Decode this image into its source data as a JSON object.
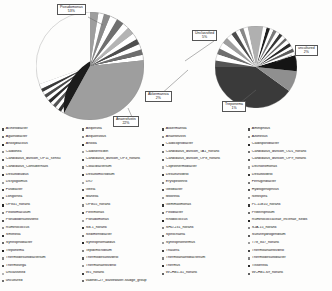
{
  "figure": {
    "background": "#fdfdfc",
    "type": "two-pie-panel"
  },
  "chart_data": [
    {
      "type": "pie",
      "title": "",
      "panel": "left",
      "legend_position": "bottom",
      "labels": [
        "Pseudomonas",
        "Akkermansia",
        "Anaerofustis",
        "Other taxa"
      ],
      "callouts": [
        {
          "name": "Pseudomonas",
          "percent": "53%"
        },
        {
          "name": "Akkermansia",
          "percent": "2%"
        },
        {
          "name": "Anaerofustis",
          "percent": "22%"
        }
      ],
      "categories": [
        "Pseudomonas",
        "Anaerofustis",
        "Akkermansia",
        "Treponema",
        "uncultured",
        "Unclassified",
        "Acinetobacter",
        "Agathobacter",
        "Anoxybacillus",
        "Coprobacillus",
        "Desulfovibrio",
        "Dictyoglomus",
        "Fusibacter",
        "Longilinea",
        "Ruminococcus",
        "Smithella",
        "Syntrophobacter",
        "Thermodesulfobacterium",
        "Thermovirga"
      ],
      "values": [
        53,
        22,
        2,
        1,
        2,
        5,
        1.1,
        0.9,
        0.8,
        0.8,
        0.7,
        0.7,
        0.6,
        0.6,
        0.6,
        0.5,
        0.5,
        0.5,
        0.4
      ]
    },
    {
      "type": "pie",
      "title": "",
      "panel": "right",
      "legend_position": "bottom",
      "labels": [
        "Unclassified",
        "uncultured",
        "Treponema"
      ],
      "callouts": [
        {
          "name": "Unclassified",
          "percent": "5%"
        },
        {
          "name": "uncultured",
          "percent": "2%"
        },
        {
          "name": "Treponema",
          "percent": "1%"
        }
      ],
      "categories": [
        "Unclassified",
        "uncultured",
        "Treponema",
        "Pseudomonas",
        "Anaerofustis",
        "Akkermansia",
        "Other taxa"
      ],
      "values": [
        5,
        2,
        1,
        34,
        26,
        6,
        26
      ]
    }
  ],
  "callouts": {
    "pseudomonas": {
      "name": "Pseudomonas",
      "percent": "53%"
    },
    "unclassified": {
      "name": "Unclassified",
      "percent": "5%"
    },
    "uncultured": {
      "name": "uncultured",
      "percent": "2%"
    },
    "akkermansia": {
      "name": "Akkermansia",
      "percent": "2%"
    },
    "treponema": {
      "name": "Treponema",
      "percent": "1%"
    },
    "anaerofustis": {
      "name": "Anaerofustis",
      "percent": "22%"
    }
  },
  "legend": {
    "columns": [
      {
        "items": [
          {
            "label": "Acinetobacter",
            "color": "#4a4a4a"
          },
          {
            "label": "Agathobacter",
            "color": "#6e6e6e"
          },
          {
            "label": "Anoxybacillus",
            "color": "#2d2d2d"
          },
          {
            "label": "Caldilinea",
            "color": "#8a8a8a"
          },
          {
            "label": "Candidatus_division_OP11_sensu",
            "color": "#555555"
          },
          {
            "label": "Candidatus_Contubernalis",
            "color": "#777777"
          },
          {
            "label": "Desulfobulbus",
            "color": "#3a3a3a"
          },
          {
            "label": "Dictyoglomus",
            "color": "#999999"
          },
          {
            "label": "Fusibacter",
            "color": "#444444"
          },
          {
            "label": "Longilinea",
            "color": "#6a6a6a"
          },
          {
            "label": "OP841_norank",
            "color": "#262626"
          },
          {
            "label": "Pelotomaculum",
            "color": "#7c7c7c"
          },
          {
            "label": "Pseudodesulfovibrio",
            "color": "#505050"
          },
          {
            "label": "Ruminococcus",
            "color": "#8f8f8f"
          },
          {
            "label": "Smithella",
            "color": "#333333"
          },
          {
            "label": "Syntrophobacter",
            "color": "#666666"
          },
          {
            "label": "Treponema",
            "color": "#1f1f1f"
          },
          {
            "label": "Thermodesulfobacterium",
            "color": "#858585"
          },
          {
            "label": "Thermovirga",
            "color": "#4f4f4f"
          },
          {
            "label": "Unclassified",
            "color": "#b4b4b4"
          },
          {
            "label": "uncultured",
            "color": "#707070"
          }
        ]
      },
      {
        "items": [
          {
            "label": "Aeqorivita",
            "color": "#5c5c5c"
          },
          {
            "label": "Aequorivillus",
            "color": "#888888"
          },
          {
            "label": "Anoxia",
            "color": "#303030"
          },
          {
            "label": "Caldiserricibin",
            "color": "#9b9b9b"
          },
          {
            "label": "Candidatus_division_OP3_norank",
            "color": "#4d4d4d"
          },
          {
            "label": "Cloacibacterium",
            "color": "#747474"
          },
          {
            "label": "Desulfomicrobium",
            "color": "#3c3c3c"
          },
          {
            "label": "DIO",
            "color": "#a2a2a2"
          },
          {
            "label": "Gelria",
            "color": "#5a5a5a"
          },
          {
            "label": "Mahella",
            "color": "#2a2a2a"
          },
          {
            "label": "OPB55_norank",
            "color": "#7e7e7e"
          },
          {
            "label": "Petrimonas",
            "color": "#4b4b4b"
          },
          {
            "label": "Pseudomonas",
            "color": "#9e9e9e"
          },
          {
            "label": "SB-1_norank",
            "color": "#353535"
          },
          {
            "label": "Sedimentibacter",
            "color": "#6b6b6b"
          },
          {
            "label": "Syntrophorhabdus",
            "color": "#282828"
          },
          {
            "label": "Tepidimicrobium",
            "color": "#828282"
          },
          {
            "label": "Thermodesulfovibrio",
            "color": "#565656"
          },
          {
            "label": "Thermanaerovibrio",
            "color": "#909090"
          },
          {
            "label": "W5_norank",
            "color": "#3f3f3f"
          },
          {
            "label": "vadinBC27_wastewater-sludge_group",
            "color": "#6f6f6f"
          }
        ]
      },
      {
        "items": [
          {
            "label": "Akkermansia",
            "color": "#464646"
          },
          {
            "label": "Anaerofustis",
            "color": "#8c8c8c"
          },
          {
            "label": "Caldicoprobacter",
            "color": "#2f2f2f"
          },
          {
            "label": "Candidatus_division_TA1_norank",
            "color": "#737373"
          },
          {
            "label": "Candidatus_division_OP8_norank",
            "color": "#5e5e5e"
          },
          {
            "label": "Coprothermobacter",
            "color": "#a5a5a5"
          },
          {
            "label": "Desulfurivibrio",
            "color": "#3b3b3b"
          },
          {
            "label": "Erysipelothrix",
            "color": "#7a7a7a"
          },
          {
            "label": "Geobacter",
            "color": "#515151"
          },
          {
            "label": "Moorella",
            "color": "#979797"
          },
          {
            "label": "Gemmatimonas",
            "color": "#343434"
          },
          {
            "label": "Pelobacter",
            "color": "#686868"
          },
          {
            "label": "Rhodococcus",
            "color": "#232323"
          },
          {
            "label": "SHD-231_norank",
            "color": "#868686"
          },
          {
            "label": "Spirochaeta",
            "color": "#595959"
          },
          {
            "label": "Syntrophothermus",
            "color": "#9a9a9a"
          },
          {
            "label": "Thauera",
            "color": "#424242"
          },
          {
            "label": "Thermoanaerobacterium",
            "color": "#7f7f7f"
          },
          {
            "label": "Thermus",
            "color": "#313131"
          },
          {
            "label": "WCHB1-41_norank",
            "color": "#636363"
          }
        ]
      },
      {
        "items": [
          {
            "label": "Aminiphilus",
            "color": "#4c4c4c"
          },
          {
            "label": "Azonexus",
            "color": "#8e8e8e"
          },
          {
            "label": "Caldisporobacter",
            "color": "#2c2c2c"
          },
          {
            "label": "Candidatus_division_OD1_norank",
            "color": "#717171"
          },
          {
            "label": "Candidatus_division_OP9_norank",
            "color": "#5b5b5b"
          },
          {
            "label": "Dechloromonas",
            "color": "#a0a0a0"
          },
          {
            "label": "Desulfovibrio",
            "color": "#383838"
          },
          {
            "label": "Ferruginibacter",
            "color": "#787878"
          },
          {
            "label": "Hydrogenophilus",
            "color": "#545454"
          },
          {
            "label": "Nitrospira",
            "color": "#949494"
          },
          {
            "label": "PL-11B10_norank",
            "color": "#373737"
          },
          {
            "label": "Proteiniphilum",
            "color": "#6c6c6c"
          },
          {
            "label": "Ruminococcaceae_Incertae_Sedis",
            "color": "#252525"
          },
          {
            "label": "SJA-15_norank",
            "color": "#898989"
          },
          {
            "label": "Sulfurihydrogenibium",
            "color": "#5d5d5d"
          },
          {
            "label": "T78_847_norank",
            "color": "#9c9c9c"
          },
          {
            "label": "Thermoanaerovibrio",
            "color": "#454545"
          },
          {
            "label": "Thermodesulfobacter",
            "color": "#818181"
          },
          {
            "label": "Tissierella",
            "color": "#2e2e2e"
          },
          {
            "label": "WCHB1-69_norank",
            "color": "#616161"
          }
        ]
      }
    ]
  }
}
